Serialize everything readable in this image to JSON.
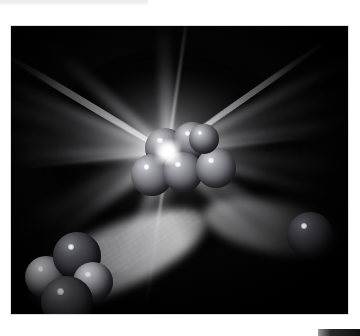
{
  "page": {
    "background_color": "#ffffff",
    "width": 360,
    "height": 336
  },
  "top_strip": {
    "name": "top-edge-strip",
    "color": "#ededf0",
    "width": 148,
    "height": 5
  },
  "bottom_bar": {
    "name": "bottom-right-bar",
    "color": "#111111",
    "width": 42,
    "height": 7
  },
  "figure": {
    "frame": {
      "x": 11,
      "y": 26,
      "width": 337,
      "height": 288
    },
    "background_color": "#010101",
    "flash": {
      "name": "central-flash",
      "center_x_pct": 46.5,
      "center_y_pct": 43.8,
      "core_color": "#ffffff",
      "halo_color": "#e1e1e4"
    },
    "colors": {
      "sphere_highlight": "#cfcfd4",
      "sphere_midtone": "#9a9aa1",
      "sphere_shadow": "#56565d",
      "sphere_dark": "#4e4e55",
      "ray_color": "#ffffff",
      "void_color": "#000000"
    },
    "rays": [
      {
        "name": "ray-upper-left-1",
        "angle_deg": 196,
        "length": 240,
        "width": 16,
        "style": "broad"
      },
      {
        "name": "ray-upper-left-2",
        "angle_deg": 203,
        "length": 215,
        "width": 11,
        "style": "soft"
      },
      {
        "name": "ray-upper-left-3",
        "angle_deg": 211,
        "length": 200,
        "width": 7,
        "style": "sharp"
      },
      {
        "name": "ray-upper-left-4",
        "angle_deg": 222,
        "length": 175,
        "width": 13,
        "style": "soft"
      },
      {
        "name": "ray-left-1",
        "angle_deg": 185,
        "length": 205,
        "width": 20,
        "style": "broad"
      },
      {
        "name": "ray-left-2",
        "angle_deg": 178,
        "length": 190,
        "width": 12,
        "style": "soft"
      },
      {
        "name": "ray-upper-right-1",
        "angle_deg": 341,
        "length": 215,
        "width": 17,
        "style": "broad"
      },
      {
        "name": "ray-upper-right-2",
        "angle_deg": 333,
        "length": 230,
        "width": 10,
        "style": "soft"
      },
      {
        "name": "ray-upper-right-3",
        "angle_deg": 325,
        "length": 200,
        "width": 6,
        "style": "sharp"
      },
      {
        "name": "ray-upper-right-4",
        "angle_deg": 350,
        "length": 205,
        "width": 13,
        "style": "soft"
      },
      {
        "name": "ray-right-1",
        "angle_deg": 5,
        "length": 195,
        "width": 18,
        "style": "broad"
      },
      {
        "name": "ray-right-2",
        "angle_deg": 14,
        "length": 175,
        "width": 11,
        "style": "soft"
      },
      {
        "name": "ray-lower-left-1",
        "angle_deg": 152,
        "length": 185,
        "width": 22,
        "style": "broad"
      },
      {
        "name": "ray-lower-left-2",
        "angle_deg": 143,
        "length": 165,
        "width": 13,
        "style": "soft"
      },
      {
        "name": "ray-lower-right-1",
        "angle_deg": 32,
        "length": 175,
        "width": 16,
        "style": "soft"
      },
      {
        "name": "ray-lower-right-2",
        "angle_deg": 44,
        "length": 160,
        "width": 11,
        "style": "soft"
      },
      {
        "name": "ray-down-1",
        "angle_deg": 100,
        "length": 175,
        "width": 18,
        "style": "broad"
      },
      {
        "name": "ray-down-2",
        "angle_deg": 112,
        "length": 160,
        "width": 12,
        "style": "soft"
      },
      {
        "name": "ray-up-1",
        "angle_deg": 268,
        "length": 150,
        "width": 14,
        "style": "soft"
      }
    ],
    "core_cluster": {
      "name": "central-nucleon-cluster",
      "label": "compound nucleus",
      "spheres": [
        {
          "name": "nucleon-core-1",
          "x": 134,
          "y": 102,
          "d": 40
        },
        {
          "name": "nucleon-core-2",
          "x": 162,
          "y": 96,
          "d": 38
        },
        {
          "name": "nucleon-core-3",
          "x": 120,
          "y": 128,
          "d": 42
        },
        {
          "name": "nucleon-core-4",
          "x": 152,
          "y": 126,
          "d": 40
        },
        {
          "name": "nucleon-core-5",
          "x": 185,
          "y": 122,
          "d": 40
        },
        {
          "name": "nucleon-core-6",
          "x": 178,
          "y": 98,
          "d": 30
        }
      ]
    },
    "fragment_left": {
      "name": "left-fragment-cluster",
      "label": "fission fragment",
      "spheres": [
        {
          "name": "nucleon-left-1",
          "x": 14,
          "y": 230,
          "d": 42,
          "tone": "light"
        },
        {
          "name": "nucleon-left-2",
          "x": 42,
          "y": 206,
          "d": 48,
          "tone": "dark"
        },
        {
          "name": "nucleon-left-3",
          "x": 62,
          "y": 236,
          "d": 40,
          "tone": "light"
        },
        {
          "name": "nucleon-left-4",
          "x": 30,
          "y": 250,
          "d": 52,
          "tone": "dark"
        }
      ]
    },
    "fragment_right": {
      "name": "right-fragment-sphere",
      "label": "ejected nucleon",
      "spheres": [
        {
          "name": "nucleon-right-1",
          "x": 276,
          "y": 186,
          "d": 46
        }
      ]
    },
    "trails": [
      {
        "name": "trail-left",
        "angle_deg": -24,
        "length": 190
      },
      {
        "name": "trail-right",
        "angle_deg": 12,
        "length": 140
      }
    ]
  }
}
